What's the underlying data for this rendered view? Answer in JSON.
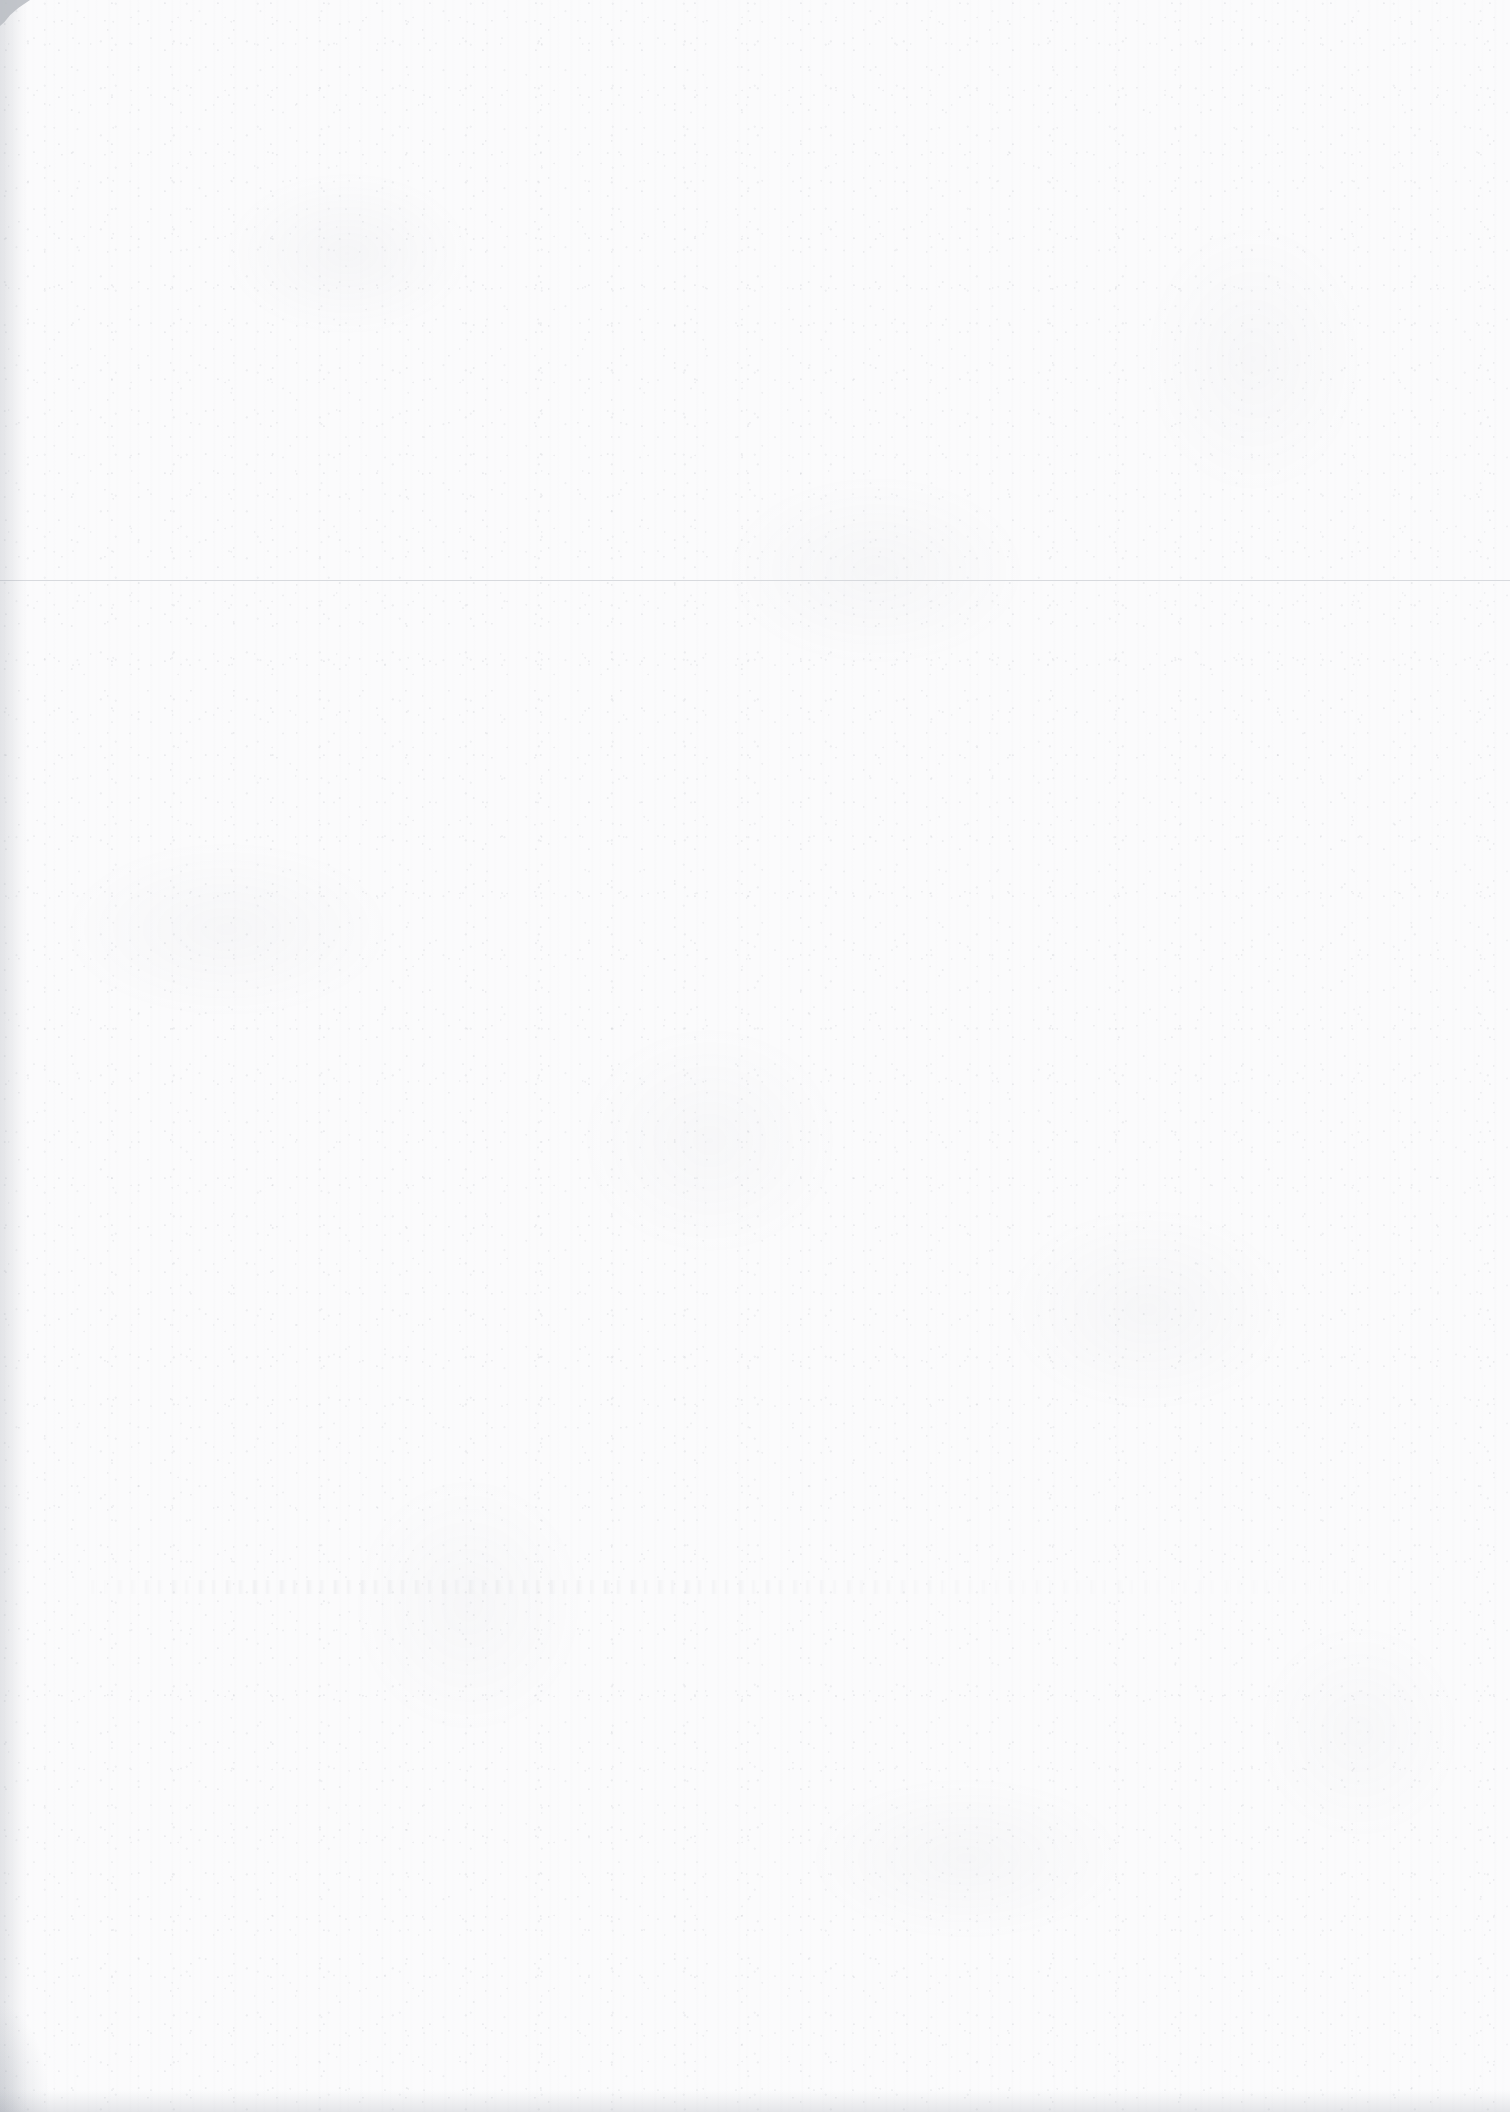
{
  "document": {
    "kind": "scanned-blank-page",
    "page_width": 1510,
    "page_height": 2112,
    "visible_text": "",
    "caption": "Blank scanned page"
  },
  "colors": {
    "paper": "#fbfbfc",
    "grain": "#969ba5",
    "rule_line": "#d8dade",
    "edge_shadow": "#8a909c",
    "corner_notch": "#b9bcc2",
    "bleed_through": "#9298a4"
  },
  "marks": {
    "rule_lines": [
      {
        "name": "horizontal-rule-upper",
        "x": 0,
        "y": 580,
        "width": 1510,
        "height": 1,
        "color": "#d8dade"
      }
    ],
    "bleed_bands": [
      {
        "name": "reverse-side-bleed-through",
        "x": 90,
        "y": 1580,
        "width": 1300,
        "height": 14
      }
    ],
    "edge_artifacts": [
      {
        "name": "corner-notch-top-left",
        "x": 0,
        "y": 0,
        "width": 30,
        "height": 26
      },
      {
        "name": "edge-shadow-left",
        "x": 0,
        "y": 0,
        "width": 26,
        "height": 2112
      },
      {
        "name": "edge-shadow-bottom",
        "x": 0,
        "y": 2090,
        "width": 1510,
        "height": 22
      },
      {
        "name": "corner-shadow-bottom-left",
        "x": 0,
        "y": 1962,
        "width": 70,
        "height": 150
      }
    ]
  }
}
